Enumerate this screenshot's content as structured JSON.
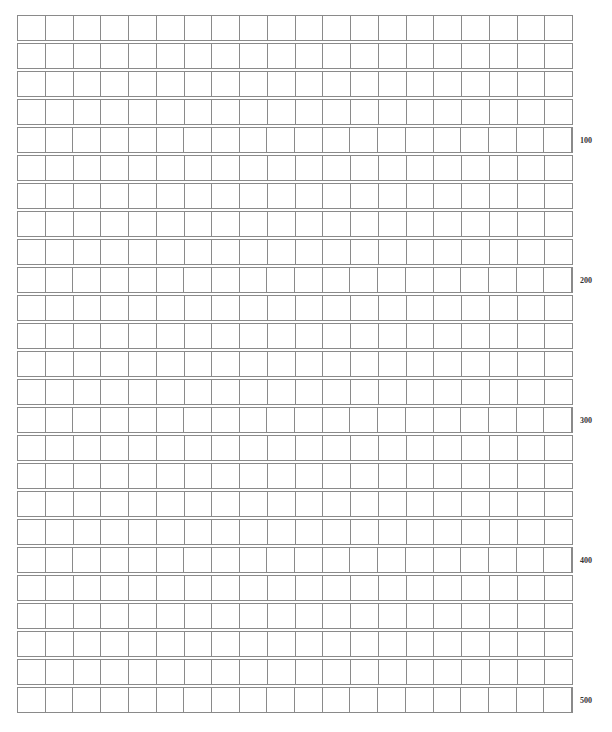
{
  "document": {
    "type": "composition-grid-paper",
    "rows": 25,
    "columns": 20,
    "line_color": "#8a8a8a",
    "background": "#ffffff",
    "cells_filled": 0
  },
  "count_labels": [
    {
      "row": 5,
      "text": "100"
    },
    {
      "row": 10,
      "text": "200"
    },
    {
      "row": 15,
      "text": "300"
    },
    {
      "row": 20,
      "text": "400"
    },
    {
      "row": 25,
      "text": "500"
    }
  ]
}
